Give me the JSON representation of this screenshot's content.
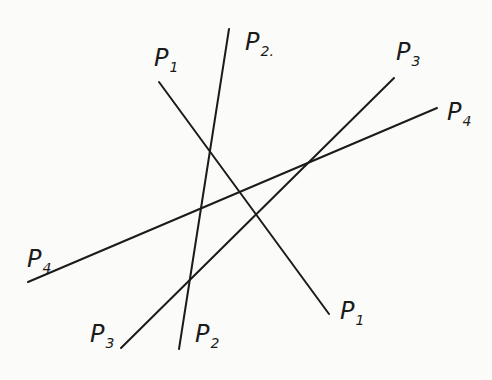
{
  "diagram": {
    "lines": [
      {
        "name": "P",
        "sub": "1",
        "x1": 159,
        "y1": 82,
        "x2": 329,
        "y2": 314
      },
      {
        "name": "P",
        "sub": "2",
        "x1": 229,
        "y1": 29,
        "x2": 179,
        "y2": 349
      },
      {
        "name": "P",
        "sub": "3",
        "x1": 394,
        "y1": 78,
        "x2": 121,
        "y2": 348
      },
      {
        "name": "P",
        "sub": "4",
        "x1": 437,
        "y1": 108,
        "x2": 28,
        "y2": 282
      }
    ],
    "labels": [
      {
        "id": "p1-top",
        "main": "P",
        "sub": "1"
      },
      {
        "id": "p2-top",
        "main": "P",
        "sub": "2."
      },
      {
        "id": "p3-top",
        "main": "P",
        "sub": "3"
      },
      {
        "id": "p4-top",
        "main": "P",
        "sub": "4"
      },
      {
        "id": "p4-bottom",
        "main": "P",
        "sub": "4"
      },
      {
        "id": "p3-bottom",
        "main": "P",
        "sub": "3"
      },
      {
        "id": "p2-bottom",
        "main": "P",
        "sub": "2"
      },
      {
        "id": "p1-bottom",
        "main": "P",
        "sub": "1"
      }
    ]
  }
}
